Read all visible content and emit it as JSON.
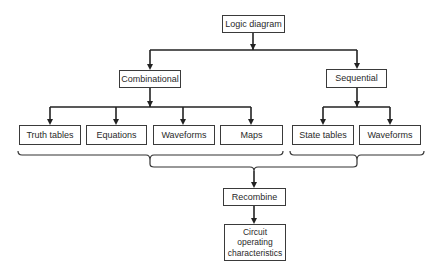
{
  "diagram": {
    "type": "hierarchy-flowchart",
    "nodes": {
      "logic_diagram": "Logic diagram",
      "combinational": "Combinational",
      "sequential": "Sequential",
      "truth_tables": "Truth tables",
      "equations": "Equations",
      "waveforms_comb": "Waveforms",
      "maps": "Maps",
      "state_tables": "State tables",
      "waveforms_seq": "Waveforms",
      "recombine": "Recombine",
      "circuit_operating": "Circuit\noperating\ncharacteristics"
    },
    "edges": [
      {
        "from": "logic_diagram",
        "to": "combinational"
      },
      {
        "from": "logic_diagram",
        "to": "sequential"
      },
      {
        "from": "combinational",
        "to": "truth_tables"
      },
      {
        "from": "combinational",
        "to": "equations"
      },
      {
        "from": "combinational",
        "to": "waveforms_comb"
      },
      {
        "from": "combinational",
        "to": "maps"
      },
      {
        "from": "sequential",
        "to": "state_tables"
      },
      {
        "from": "sequential",
        "to": "waveforms_seq"
      },
      {
        "group": [
          "truth_tables",
          "equations",
          "waveforms_comb",
          "maps"
        ],
        "brace": true
      },
      {
        "group": [
          "state_tables",
          "waveforms_seq"
        ],
        "brace": true
      },
      {
        "from": "both-groups",
        "to": "recombine",
        "brace": true
      },
      {
        "from": "recombine",
        "to": "circuit_operating"
      }
    ]
  }
}
